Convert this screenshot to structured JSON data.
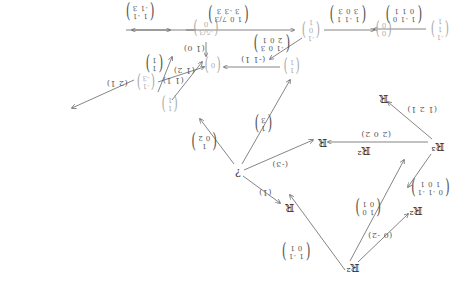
{
  "diagram": {
    "orientation": "rotated 180 degrees",
    "nodes": [
      {
        "id": "R2_bottom",
        "label": "ℝ²",
        "x": 95,
        "y": 25,
        "faint": false
      },
      {
        "id": "R2_left",
        "label": "ℝ²",
        "x": 32,
        "y": 82,
        "faint": false
      },
      {
        "id": "R2_mid",
        "label": "ℝ²",
        "x": 84,
        "y": 142,
        "faint": false
      },
      {
        "id": "R3",
        "label": "ℝ³",
        "x": 10,
        "y": 146,
        "faint": false
      },
      {
        "id": "R_bottom",
        "label": "ℝ",
        "x": 158,
        "y": 85,
        "faint": false
      },
      {
        "id": "R_left",
        "label": "ℝ",
        "x": 64,
        "y": 194,
        "faint": false
      },
      {
        "id": "R_mid",
        "label": "ℝ",
        "x": 125,
        "y": 150,
        "faint": false
      },
      {
        "id": "question",
        "label": "?",
        "x": 210,
        "y": 120,
        "faint": false
      },
      {
        "id": "v_11",
        "label": [
          "1",
          "1"
        ],
        "x": 278,
        "y": 188,
        "faint": true,
        "matrix": true
      },
      {
        "id": "v_left",
        "label": [
          "1",
          "1"
        ],
        "x": 156,
        "y": 226,
        "faint": true,
        "matrix": true
      },
      {
        "id": "v_zero_center",
        "label": [
          "0"
        ],
        "x": 235,
        "y": 227,
        "faint": true,
        "matrix": true
      },
      {
        "id": "v_neg",
        "label": [
          "-1",
          "-3"
        ],
        "x": 302,
        "y": 210,
        "faint": true,
        "matrix": true
      },
      {
        "id": "v_top_mid",
        "label": [
          "-5/3",
          "0"
        ],
        "x": 242,
        "y": 264,
        "faint": true,
        "matrix": true
      },
      {
        "id": "v_top_right",
        "label": [
          "-1",
          "0",
          "1"
        ],
        "x": 137,
        "y": 262,
        "faint": true,
        "matrix": true
      },
      {
        "id": "v_zero_right",
        "label": [
          "0",
          "0"
        ],
        "x": 64,
        "y": 263,
        "faint": true,
        "matrix": true
      },
      {
        "id": "v_far_right",
        "label": [
          "-1",
          "1",
          "1"
        ],
        "x": 8,
        "y": 263,
        "faint": true,
        "matrix": true
      }
    ],
    "edges": [
      {
        "from": [
          103,
          22
        ],
        "to": [
          158,
          97
        ],
        "label": [
          "1 -1",
          "0 1"
        ],
        "lx": 152,
        "ly": 40
      },
      {
        "from": [
          98,
          31
        ],
        "to": [
          44,
          132
        ],
        "label": [
          "1 0",
          "0 1"
        ],
        "lx": 80,
        "ly": 84,
        "note": "crossing"
      },
      {
        "from": [
          90,
          30
        ],
        "to": [
          40,
          78
        ],
        "label_row": "(0 -2)",
        "lx": 68,
        "ly": 57
      },
      {
        "from": [
          20,
          150
        ],
        "to": [
          120,
          150
        ],
        "label_row": "(2 0 2)",
        "lx": 72,
        "ly": 158
      },
      {
        "from": [
          17,
          138
        ],
        "to": [
          40,
          105
        ],
        "label": [
          "0 -1 -1",
          "1 0 1"
        ],
        "lx": 18,
        "ly": 104
      },
      {
        "from": [
          16,
          153
        ],
        "to": [
          60,
          190
        ],
        "label_row": "(1 2 1)",
        "lx": 26,
        "ly": 183
      },
      {
        "from": [
          205,
          116
        ],
        "to": [
          168,
          89
        ],
        "label_row": "(1)",
        "lx": 183,
        "ly": 100
      },
      {
        "from": [
          204,
          122
        ],
        "to": [
          135,
          152
        ],
        "label_row": "(-3)",
        "lx": 168,
        "ly": 128
      },
      {
        "from": [
          214,
          128
        ],
        "to": [
          248,
          173
        ],
        "label": [
          "1",
          "0 2"
        ],
        "lx": 244,
        "ly": 150
      },
      {
        "from": [
          206,
          128
        ],
        "to": [
          158,
          212
        ],
        "label": [
          "1",
          "3"
        ],
        "lx": 185,
        "ly": 168
      },
      {
        "from": [
          290,
          200
        ],
        "to": [
          276,
          235
        ],
        "label": [
          "1",
          "1"
        ],
        "lx": 294,
        "ly": 228
      },
      {
        "from": [
          276,
          192
        ],
        "to": [
          246,
          230
        ],
        "label_row": "(1 1)",
        "lx": 275,
        "ly": 212
      },
      {
        "from": [
          314,
          212
        ],
        "to": [
          376,
          184
        ],
        "label_row": "(2 1)",
        "lx": 331,
        "ly": 209
      },
      {
        "from": [
          168,
          225
        ],
        "to": [
          224,
          225
        ],
        "label_row": "(-1 1)",
        "lx": 195,
        "ly": 233
      },
      {
        "from": [
          290,
          210
        ],
        "to": [
          244,
          225
        ],
        "label_row": "(1 2)",
        "lx": 264,
        "ly": 222
      },
      {
        "from": [
          262,
          262
        ],
        "to": [
          154,
          262
        ],
        "label_row": "",
        "lx": 0,
        "ly": 0
      },
      {
        "from": [
          242,
          250
        ],
        "to": [
          242,
          236
        ],
        "label_row": "(1 0)",
        "lx": 254,
        "ly": 244
      },
      {
        "from": [
          146,
          254
        ],
        "to": [
          178,
          233
        ],
        "label": [
          "-1 0 3",
          "2 0 1"
        ],
        "lx": 176,
        "ly": 248
      },
      {
        "from": [
          124,
          262
        ],
        "to": [
          74,
          262
        ],
        "label": [
          "1 -1 1",
          "3 0 3"
        ],
        "lx": 100,
        "ly": 277
      },
      {
        "from": [
          22,
          263
        ],
        "to": [
          74,
          263
        ],
        "label": [
          "1 -1 0",
          "0 1 1"
        ],
        "lx": 44,
        "ly": 277
      },
      {
        "from": [
          252,
          262
        ],
        "to": [
          316,
          262
        ],
        "label": [
          "1 0 7/3",
          "3 -3 3"
        ],
        "lx": 220,
        "ly": 277
      },
      {
        "from": [
          322,
          262
        ],
        "to": [
          278,
          262
        ],
        "label": [
          "1 -1",
          "-1 3"
        ],
        "lx": 308,
        "ly": 280
      }
    ]
  }
}
